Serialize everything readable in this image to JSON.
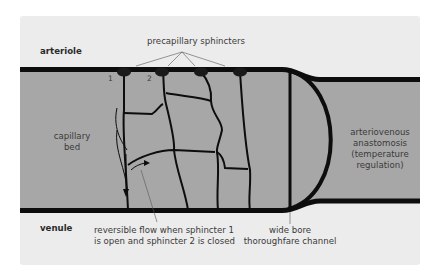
{
  "diagram": {
    "colors": {
      "panel": "#ececec",
      "vessel_fill": "#a7a7a7",
      "vessel_wall": "#0d0d0d",
      "text": "#3a3a3a"
    },
    "labels": {
      "arteriole": "arteriole",
      "venule": "venule",
      "precapillary_sphincters": "precapillary sphincters",
      "capillary_bed_line1": "capillary",
      "capillary_bed_line2": "bed",
      "av_line1": "arteriovenous",
      "av_line2": "anastomosis",
      "av_line3": "(temperature",
      "av_line4": "regulation)",
      "reversible_line1": "reversible flow when sphincter 1",
      "reversible_line2": "is open and sphincter 2 is closed",
      "thoroughfare_line1": "wide bore",
      "thoroughfare_line2": "thoroughfare channel"
    },
    "sphincter_numbers": [
      "1",
      "2"
    ],
    "sphincter_count": 4
  }
}
